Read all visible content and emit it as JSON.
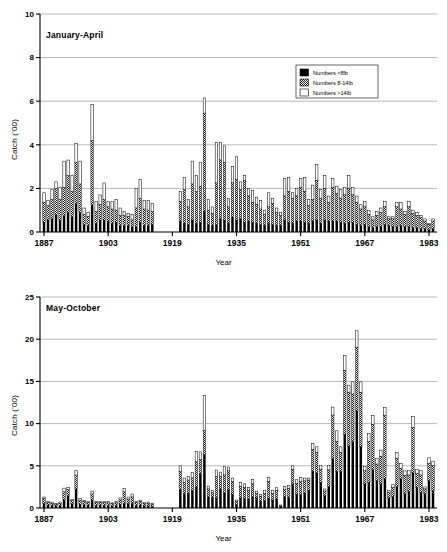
{
  "figure": {
    "axis_label_x": "Year",
    "axis_label_y": "Catch ('00)"
  },
  "legend": {
    "items": [
      {
        "label": "Numbers <8lb",
        "swatch": "solid-black-swatch",
        "color": "#000000"
      },
      {
        "label": "Numbers 8-14lb",
        "swatch": "stippled-grey-swatch",
        "color": "#8a8a8a"
      },
      {
        "label": "Numbers >14lb",
        "swatch": "white-outline-swatch",
        "color": "#ffffff"
      }
    ]
  },
  "chart_data": [
    {
      "type": "bar",
      "stacked": true,
      "id": "january-april",
      "title": "January-April",
      "xlabel": "Year",
      "ylabel": "Catch ('00)",
      "ylim": [
        0,
        10
      ],
      "yticks": [
        0,
        2,
        4,
        6,
        8,
        10
      ],
      "xlim": [
        1886,
        1985
      ],
      "xticks": [
        1887,
        1903,
        1919,
        1935,
        1951,
        1967,
        1983
      ],
      "grid": "horizontal",
      "legend_position": "upper-right",
      "series": [
        {
          "name": "Numbers <8lb",
          "color": "#000000"
        },
        {
          "name": "Numbers 8-14lb",
          "color": "#8a8a8a"
        },
        {
          "name": "Numbers >14lb",
          "color": "#ffffff"
        }
      ],
      "years": [
        1887,
        1888,
        1889,
        1890,
        1891,
        1892,
        1893,
        1894,
        1895,
        1896,
        1897,
        1898,
        1899,
        1900,
        1901,
        1902,
        1903,
        1904,
        1905,
        1906,
        1907,
        1908,
        1909,
        1910,
        1911,
        1912,
        1913,
        1914,
        1921,
        1922,
        1923,
        1924,
        1925,
        1926,
        1927,
        1928,
        1929,
        1930,
        1931,
        1932,
        1933,
        1934,
        1935,
        1936,
        1937,
        1938,
        1939,
        1940,
        1941,
        1942,
        1943,
        1944,
        1945,
        1946,
        1947,
        1948,
        1949,
        1950,
        1951,
        1952,
        1953,
        1954,
        1955,
        1956,
        1957,
        1958,
        1959,
        1960,
        1961,
        1962,
        1963,
        1964,
        1965,
        1966,
        1967,
        1968,
        1969,
        1970,
        1971,
        1972,
        1973,
        1974,
        1975,
        1976,
        1977,
        1978,
        1979,
        1980,
        1981,
        1982,
        1983,
        1984
      ],
      "values_small": [
        0.45,
        0.55,
        0.6,
        0.8,
        0.55,
        0.75,
        0.9,
        0.7,
        1.3,
        0.9,
        0.35,
        0.3,
        1.25,
        0.4,
        0.55,
        0.55,
        0.5,
        0.4,
        0.45,
        0.3,
        0.3,
        0.3,
        0.25,
        0.25,
        0.45,
        0.3,
        0.3,
        0.35,
        0.5,
        0.4,
        0.35,
        0.55,
        0.4,
        0.45,
        0.95,
        0.35,
        0.3,
        0.35,
        0.6,
        0.55,
        0.4,
        0.7,
        0.55,
        0.6,
        0.45,
        0.5,
        0.45,
        0.4,
        0.35,
        0.3,
        0.4,
        0.35,
        0.3,
        0.3,
        0.55,
        0.45,
        0.4,
        0.5,
        0.5,
        0.45,
        0.4,
        0.5,
        0.55,
        0.4,
        0.55,
        0.5,
        0.5,
        0.5,
        0.45,
        0.4,
        0.45,
        0.45,
        0.35,
        0.3,
        0.35,
        0.25,
        0.2,
        0.25,
        0.25,
        0.35,
        0.3,
        0.25,
        0.25,
        0.3,
        0.25,
        0.25,
        0.2,
        0.2,
        0.15,
        0.15,
        0.1,
        0.15
      ],
      "values_mid": [
        0.9,
        0.65,
        0.9,
        1.2,
        0.95,
        1.3,
        1.7,
        1.15,
        1.9,
        1.3,
        0.45,
        0.4,
        2.95,
        0.55,
        0.7,
        0.95,
        0.65,
        0.65,
        0.55,
        0.45,
        0.45,
        0.4,
        0.3,
        0.85,
        1.1,
        0.75,
        0.7,
        0.6,
        0.9,
        1.55,
        0.8,
        1.65,
        1.45,
        1.65,
        4.5,
        0.65,
        0.55,
        1.9,
        2.7,
        2.65,
        0.75,
        1.55,
        1.85,
        1.35,
        1.9,
        1.15,
        0.9,
        0.85,
        0.7,
        0.5,
        0.75,
        0.95,
        0.6,
        0.45,
        1.1,
        1.4,
        1.15,
        1.15,
        1.55,
        1.4,
        0.8,
        1.0,
        1.8,
        1.15,
        1.45,
        0.85,
        1.55,
        1.25,
        1.1,
        1.3,
        1.55,
        1.25,
        1.0,
        0.75,
        0.8,
        0.55,
        0.35,
        0.5,
        0.65,
        0.8,
        0.3,
        0.35,
        0.9,
        0.75,
        0.55,
        0.9,
        0.65,
        0.55,
        0.5,
        0.35,
        0.25,
        0.35
      ],
      "values_large": [
        0.45,
        0.25,
        0.45,
        0.3,
        0.55,
        1.2,
        0.7,
        0.75,
        0.85,
        1.05,
        0.3,
        0.2,
        1.65,
        0.45,
        0.45,
        0.75,
        0.25,
        0.35,
        0.5,
        0.35,
        0.2,
        0.15,
        0.25,
        0.9,
        0.85,
        0.4,
        0.45,
        0.35,
        0.45,
        0.55,
        0.35,
        1.05,
        0.75,
        1.1,
        0.7,
        0.5,
        0.3,
        1.85,
        0.8,
        0.75,
        0.4,
        0.75,
        1.05,
        0.35,
        0.25,
        0.35,
        0.55,
        0.35,
        0.4,
        0.2,
        0.65,
        0.25,
        0.2,
        0.15,
        0.8,
        0.65,
        0.25,
        0.35,
        0.4,
        0.65,
        0.3,
        0.65,
        0.75,
        0.4,
        0.6,
        0.3,
        0.4,
        0.35,
        0.4,
        0.35,
        0.6,
        0.35,
        0.3,
        0.2,
        0.25,
        0.2,
        0.15,
        0.2,
        0.2,
        0.25,
        0.1,
        0.1,
        0.2,
        0.3,
        0.15,
        0.25,
        0.15,
        0.15,
        0.1,
        0.1,
        0.05,
        0.1
      ],
      "peak": {
        "year": 1927,
        "value": 8.5
      },
      "notes": "Gap in record 1915-1920 (no data)."
    },
    {
      "type": "bar",
      "stacked": true,
      "id": "may-october",
      "title": "May-October",
      "xlabel": "Year",
      "ylabel": "Catch ('00)",
      "ylim": [
        0,
        25
      ],
      "yticks": [
        0,
        5,
        10,
        15,
        20,
        25
      ],
      "xlim": [
        1886,
        1985
      ],
      "xticks": [
        1887,
        1903,
        1919,
        1935,
        1951,
        1967,
        1983
      ],
      "grid": "horizontal",
      "legend_position": "none",
      "series": [
        {
          "name": "Numbers <8lb",
          "color": "#000000"
        },
        {
          "name": "Numbers 8-14lb",
          "color": "#8a8a8a"
        },
        {
          "name": "Numbers >14lb",
          "color": "#ffffff"
        }
      ],
      "years": [
        1887,
        1888,
        1889,
        1890,
        1891,
        1892,
        1893,
        1894,
        1895,
        1896,
        1897,
        1898,
        1899,
        1900,
        1901,
        1902,
        1903,
        1904,
        1905,
        1906,
        1907,
        1908,
        1909,
        1910,
        1911,
        1912,
        1913,
        1914,
        1921,
        1922,
        1923,
        1924,
        1925,
        1926,
        1927,
        1928,
        1929,
        1930,
        1931,
        1932,
        1933,
        1934,
        1935,
        1936,
        1937,
        1938,
        1939,
        1940,
        1941,
        1942,
        1943,
        1944,
        1945,
        1946,
        1947,
        1948,
        1949,
        1950,
        1951,
        1952,
        1953,
        1954,
        1955,
        1956,
        1957,
        1958,
        1959,
        1960,
        1961,
        1962,
        1963,
        1964,
        1965,
        1966,
        1967,
        1968,
        1969,
        1970,
        1971,
        1972,
        1973,
        1974,
        1975,
        1976,
        1977,
        1978,
        1979,
        1980,
        1981,
        1982,
        1983,
        1984
      ],
      "values_small": [
        0.55,
        0.35,
        0.3,
        0.25,
        0.3,
        0.95,
        1.45,
        0.5,
        2.25,
        0.45,
        0.4,
        0.35,
        0.95,
        0.3,
        0.35,
        0.3,
        0.3,
        0.25,
        0.3,
        0.45,
        0.55,
        0.5,
        0.55,
        0.3,
        0.35,
        0.25,
        0.25,
        0.2,
        2.2,
        1.7,
        1.75,
        2.1,
        2.5,
        4.05,
        6.35,
        1.35,
        1.25,
        1.2,
        2.25,
        1.85,
        2.15,
        1.65,
        0.45,
        1.2,
        1.15,
        1.05,
        1.3,
        1.2,
        0.8,
        0.85,
        1.15,
        0.95,
        1.05,
        0.2,
        1.35,
        1.25,
        2.85,
        1.65,
        1.6,
        1.75,
        2.1,
        4.35,
        4.15,
        3.05,
        1.45,
        2.55,
        5.85,
        4.35,
        4.35,
        8.75,
        7.35,
        7.85,
        11.5,
        7.25,
        2.85,
        3.05,
        4.55,
        3.25,
        2.85,
        3.5,
        1.2,
        1.35,
        2.55,
        3.45,
        1.7,
        1.95,
        4.15,
        2.45,
        1.85,
        1.7,
        3.25,
        2.05
      ],
      "values_mid": [
        0.55,
        0.3,
        0.25,
        0.2,
        0.25,
        0.95,
        0.75,
        0.35,
        1.65,
        0.45,
        0.35,
        0.3,
        0.7,
        0.35,
        0.3,
        0.35,
        0.3,
        0.25,
        0.3,
        0.5,
        1.35,
        0.55,
        0.75,
        0.35,
        0.4,
        0.3,
        0.3,
        0.25,
        2.15,
        1.3,
        1.55,
        1.45,
        2.95,
        1.65,
        2.85,
        0.9,
        0.55,
        2.55,
        1.45,
        2.05,
        2.25,
        1.45,
        0.35,
        1.35,
        1.25,
        1.05,
        1.55,
        0.55,
        0.55,
        0.9,
        1.95,
        0.75,
        1.0,
        0.1,
        0.85,
        1.05,
        1.7,
        1.25,
        1.55,
        1.45,
        1.2,
        2.55,
        2.45,
        1.55,
        0.55,
        1.95,
        5.15,
        3.55,
        2.25,
        7.55,
        6.35,
        5.65,
        7.55,
        6.45,
        1.55,
        4.85,
        5.35,
        1.95,
        3.25,
        7.45,
        0.65,
        1.05,
        3.35,
        1.25,
        2.15,
        1.95,
        5.35,
        1.65,
        2.05,
        0.55,
        2.05,
        2.95
      ],
      "values_large": [
        0.2,
        0.1,
        0.15,
        0.1,
        0.15,
        0.45,
        0.25,
        0.15,
        0.55,
        0.2,
        0.15,
        0.15,
        0.35,
        0.15,
        0.15,
        0.15,
        0.15,
        0.1,
        0.15,
        0.25,
        0.4,
        0.25,
        0.35,
        0.15,
        0.15,
        0.1,
        0.15,
        0.1,
        0.65,
        0.55,
        0.45,
        0.65,
        1.25,
        0.95,
        4.15,
        0.35,
        0.25,
        0.75,
        0.55,
        1.05,
        0.45,
        0.45,
        0.15,
        0.45,
        0.45,
        0.35,
        0.55,
        0.25,
        0.25,
        0.35,
        0.55,
        0.35,
        0.35,
        0.05,
        0.35,
        0.35,
        0.45,
        0.45,
        0.45,
        0.35,
        0.25,
        0.75,
        0.65,
        0.45,
        0.25,
        0.55,
        0.95,
        1.25,
        0.65,
        1.75,
        0.85,
        1.45,
        1.95,
        1.25,
        0.55,
        0.95,
        1.05,
        0.65,
        0.75,
        0.95,
        0.25,
        0.35,
        0.65,
        0.55,
        0.55,
        0.55,
        1.35,
        0.45,
        0.55,
        0.25,
        0.65,
        0.55
      ],
      "peak": {
        "year": 1964,
        "value": 21.0
      },
      "notes": "Gap in record 1915-1920 (no data)."
    }
  ]
}
